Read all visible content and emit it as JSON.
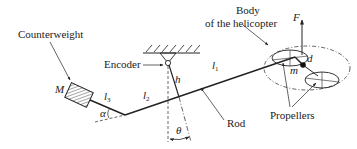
{
  "diagram": {
    "colors": {
      "ink": "#222222",
      "background": "#ffffff"
    },
    "labels": {
      "counterweight": "Counterweight",
      "encoder": "Encoder",
      "body_line1": "Body",
      "body_line2": "of the helicopter",
      "rod": "Rod",
      "propellers": "Propellers"
    },
    "symbols": {
      "M": "M",
      "l3": "l",
      "l3_sub": "3",
      "l2": "l",
      "l2_sub": "2",
      "l1": "l",
      "l1_sub": "1",
      "alpha": "α",
      "h": "h",
      "theta": "θ",
      "F": "F",
      "d": "d",
      "m": "m"
    }
  }
}
